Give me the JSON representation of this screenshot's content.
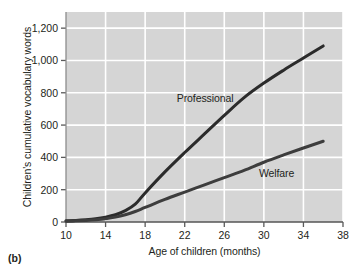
{
  "figure": {
    "panel_label": "(b)"
  },
  "chart_data": {
    "type": "line",
    "title": "",
    "xlabel": "Age of children (months)",
    "ylabel": "Children's cumulative vocabulary words",
    "xlim": [
      10,
      38
    ],
    "ylim": [
      0,
      1300
    ],
    "xticks": [
      10,
      14,
      18,
      22,
      26,
      30,
      34,
      38
    ],
    "xtick_labels": [
      "10",
      "14",
      "18",
      "22",
      "26",
      "30",
      "34",
      "38"
    ],
    "yticks": [
      0,
      200,
      400,
      600,
      800,
      1000,
      1200
    ],
    "ytick_labels": [
      "0",
      "200",
      "400",
      "600",
      "800",
      "1,000",
      "1,200"
    ],
    "grid": true,
    "grid_color": "#ffffff",
    "plot_background": "#d5d5d5",
    "legend": "inline-annotations",
    "series": [
      {
        "name": "Professional",
        "label": "Professional",
        "color": "#2b2b2b",
        "x": [
          10,
          11,
          12,
          13,
          14,
          15,
          16,
          17,
          18,
          20,
          22,
          24,
          26,
          28,
          30,
          32,
          34,
          36
        ],
        "values": [
          8,
          10,
          14,
          20,
          30,
          45,
          70,
          110,
          180,
          310,
          430,
          545,
          660,
          770,
          860,
          940,
          1015,
          1090
        ]
      },
      {
        "name": "Welfare",
        "label": "Welfare",
        "color": "#3d3d3d",
        "x": [
          10,
          11,
          12,
          13,
          14,
          15,
          16,
          17,
          18,
          20,
          22,
          24,
          26,
          28,
          30,
          32,
          34,
          36
        ],
        "values": [
          5,
          7,
          10,
          14,
          20,
          30,
          45,
          65,
          90,
          140,
          185,
          230,
          275,
          320,
          370,
          415,
          458,
          500
        ]
      }
    ],
    "annotations": [
      {
        "text": "Professional",
        "x": 21.2,
        "y": 760
      },
      {
        "text": "Welfare",
        "x": 29.5,
        "y": 300
      }
    ]
  }
}
